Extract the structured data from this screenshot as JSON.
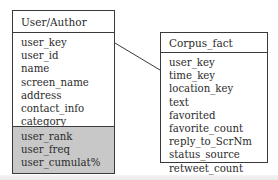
{
  "diagram": {
    "type": "entity-relationship",
    "entities": [
      {
        "id": "user-author",
        "title": "User/Author",
        "attributes": [
          "user_key",
          "user_id",
          "name",
          "screen_name",
          "address",
          "contact_info",
          "category"
        ],
        "derived_attributes": [
          "user_rank",
          "user_freq",
          "user_cumulat%"
        ],
        "derived_fill": "#c8c8c8"
      },
      {
        "id": "corpus-fact",
        "title": "Corpus_fact",
        "attributes": [
          "user_key",
          "time_key",
          "location_key",
          "text",
          "favorited",
          "favorite_count",
          "reply_to_ScrNm",
          "status_source",
          "retweet_count"
        ]
      }
    ],
    "relationships": [
      {
        "from": "User/Author",
        "to": "Corpus_fact",
        "style": "line"
      }
    ],
    "colors": {
      "border": "#3a3a3a",
      "text": "#2b2b2b",
      "shaded_section": "#c8c8c8"
    }
  }
}
